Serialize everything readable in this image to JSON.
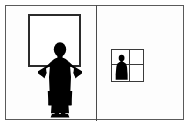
{
  "diagram": {
    "title": "Person holding a blank square canvas beside a quartered square containing a small figure",
    "background_color": "#ffffff",
    "silhouette_color": "#000000",
    "line_color": "#2b2b2b",
    "border_color": "#5a5a5a",
    "outer_border": {
      "label": "outer image border",
      "x": 5,
      "y": 5,
      "width": 179,
      "height": 115
    },
    "divider": {
      "label": "vertical panel divider",
      "x": 96,
      "y": 5,
      "height": 116
    },
    "panels": [
      {
        "id": "left",
        "label": "Panel A",
        "caption": "Standing figure holding large empty square frame",
        "figure": {
          "name": "standing-person-silhouette",
          "pose": "front-facing, arms raised outward holding frame edge",
          "fill": "#000000"
        },
        "frame": {
          "name": "large-square-canvas",
          "label": "blank square canvas",
          "x": 28,
          "y": 14,
          "size": 53,
          "stroke": "#2b2b2b",
          "stroke_width": 2,
          "fill": "#ffffff",
          "divisions": 1
        }
      },
      {
        "id": "right",
        "label": "Panel B",
        "caption": "Small square divided into four quadrants with a seated bust figure",
        "figure": {
          "name": "bust-person-silhouette",
          "pose": "head and shoulders, lower-left quadrant",
          "fill": "#000000"
        },
        "frame": {
          "name": "small-quartered-square",
          "label": "square divided into quadrants",
          "x": 111,
          "y": 49,
          "size": 33,
          "stroke": "#3a3a3a",
          "stroke_width": 1,
          "fill": "#ffffff",
          "divisions": 4,
          "grid_vertical_offset": 17,
          "grid_horizontal_offset": 14
        }
      }
    ]
  }
}
